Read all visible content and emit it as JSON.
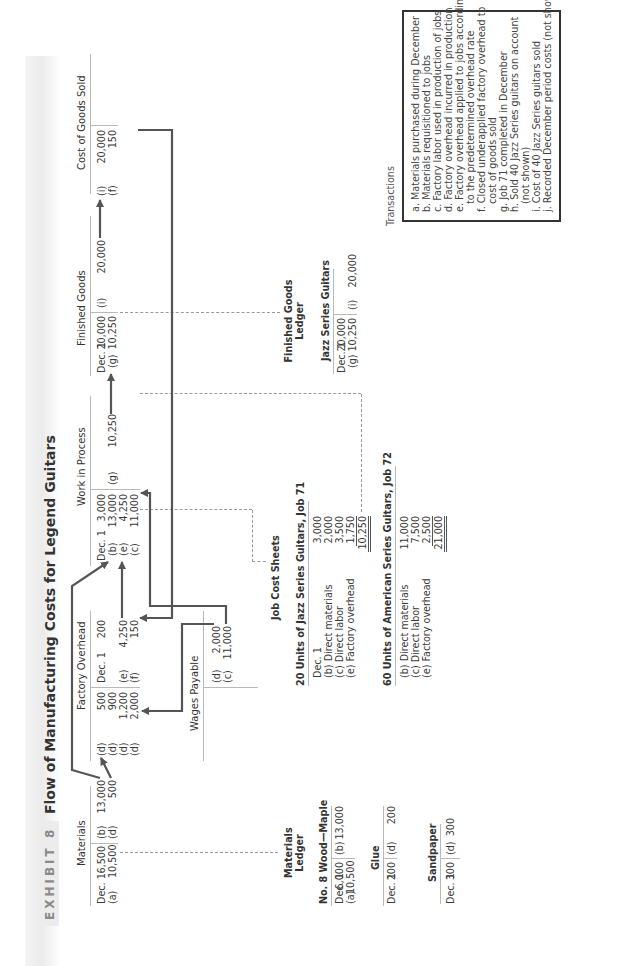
{
  "exhibit": {
    "label": "EXHIBIT 8",
    "title": "Flow of Manufacturing Costs for Legend Guitars"
  },
  "t_accounts": {
    "materials": {
      "title": "Materials",
      "debits": [
        [
          "Dec. 1",
          "6,500"
        ],
        [
          "(a)",
          "10,500"
        ]
      ],
      "credits": [
        [
          "(b)",
          "13,000"
        ],
        [
          "(d)",
          "500"
        ]
      ]
    },
    "factory_overhead": {
      "title": "Factory Overhead",
      "debits": [
        [
          "(d)",
          "500"
        ],
        [
          "(d)",
          "900"
        ],
        [
          "(d)",
          "1,200"
        ],
        [
          "(d)",
          "2,000"
        ]
      ],
      "credits": [
        [
          "Dec. 1",
          "200"
        ],
        [
          "",
          ""
        ],
        [
          "(e)",
          "4,250"
        ],
        [
          "(f)",
          "150"
        ]
      ]
    },
    "wages_payable": {
      "title": "Wages Payable",
      "credits": [
        [
          "(d)",
          "2,000"
        ],
        [
          "(c)",
          "11,000"
        ]
      ]
    },
    "work_in_process": {
      "title": "Work in Process",
      "debits": [
        [
          "Dec. 1",
          "3,000"
        ],
        [
          "(b)",
          "13,000"
        ],
        [
          "(e)",
          "4,250"
        ],
        [
          "(c)",
          "11,000"
        ]
      ],
      "credits": [
        [
          "(g)",
          "10,250"
        ]
      ]
    },
    "finished_goods": {
      "title": "Finished Goods",
      "debits": [
        [
          "Dec. 1",
          "20,000"
        ],
        [
          "(g)",
          "10,250"
        ]
      ],
      "credits": [
        [
          "(i)",
          "20,000"
        ]
      ]
    },
    "cost_of_goods_sold": {
      "title": "Cost of Goods Sold",
      "debits": [
        [
          "(i)",
          "20,000"
        ],
        [
          "(f)",
          "150"
        ]
      ]
    }
  },
  "materials_ledger": {
    "title_line1": "Materials",
    "title_line2": "Ledger",
    "wood": {
      "title": "No. 8 Wood—Maple",
      "debits": [
        [
          "Dec. 1",
          "6,000"
        ],
        [
          "(a)",
          "10,500"
        ]
      ],
      "credits": [
        [
          "(b)",
          "13,000"
        ]
      ]
    },
    "glue": {
      "title": "Glue",
      "debits": [
        [
          "Dec. 1",
          "200"
        ]
      ],
      "credits": [
        [
          "(d)",
          "200"
        ]
      ]
    },
    "sandpaper": {
      "title": "Sandpaper",
      "debits": [
        [
          "Dec. 1",
          "300"
        ]
      ],
      "credits": [
        [
          "(d)",
          "300"
        ]
      ]
    }
  },
  "job_cost_sheets": {
    "title": "Job Cost Sheets",
    "job71": {
      "title": "20 Units of Jazz Series Guitars, Job 71",
      "lines": [
        [
          "Dec. 1",
          "3,000"
        ],
        [
          "(b) Direct materials",
          "2,000"
        ],
        [
          "(c) Direct labor",
          "3,500"
        ],
        [
          "(e) Factory overhead",
          "1,750"
        ]
      ],
      "total": "10,250"
    },
    "job72": {
      "title": "60 Units of American Series Guitars, Job 72",
      "lines": [
        [
          "(b) Direct materials",
          "11,000"
        ],
        [
          "(c) Direct labor",
          "7,500"
        ],
        [
          "(e) Factory overhead",
          "2,500"
        ]
      ],
      "total": "21,000"
    }
  },
  "finished_goods_ledger": {
    "title_line1": "Finished Goods",
    "title_line2": "Ledger",
    "jazz": {
      "title": "Jazz Series Guitars",
      "debits": [
        [
          "Dec. 1",
          "20,000"
        ],
        [
          "(g)",
          "10,250"
        ]
      ],
      "credits": [
        [
          "(i)",
          "20,000"
        ]
      ]
    }
  },
  "transactions": {
    "heading": "Transactions",
    "items": [
      "a. Materials purchased during December",
      "b. Materials requisitioned to jobs",
      "c. Factory labor used in production of jobs",
      "d. Factory overhead incurred in production",
      "e. Factory overhead applied to jobs according",
      "to the predetermined overhead rate",
      "f. Closed underapplied factory overhead to",
      "cost of goods sold",
      "g. Job 71 completed in December",
      "h. Sold 40 Jazz Series guitars on account",
      "(not shown)",
      "i. Cost of 40 Jazz Series guitars sold",
      "j. Recorded December period costs (not shown)"
    ]
  },
  "colors": {
    "arrow": "#555555",
    "rule": "#b9b9b9",
    "dashed": "#9a9a9a",
    "box_border": "#333333"
  }
}
